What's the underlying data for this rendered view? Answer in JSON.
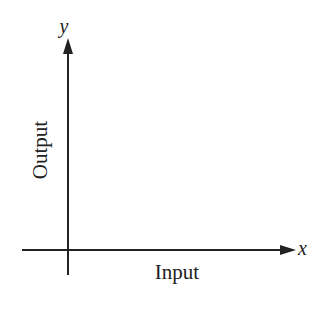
{
  "diagram": {
    "x_axis_letter": "x",
    "y_axis_letter": "y",
    "x_axis_label": "Input",
    "y_axis_label": "Output",
    "line_color": "#222222"
  }
}
